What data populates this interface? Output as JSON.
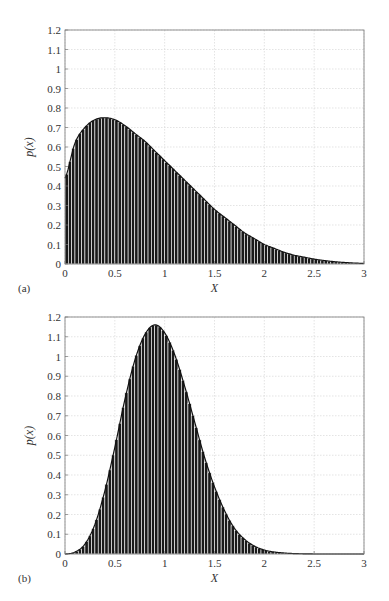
{
  "header_fragment": "",
  "chart_data": [
    {
      "type": "bar",
      "panel_label": "(a)",
      "title": "",
      "xlabel": "X",
      "ylabel": "p(x)",
      "xlim": [
        0,
        3
      ],
      "ylim": [
        0,
        1.2
      ],
      "xticks": [
        0,
        0.5,
        1,
        1.5,
        2,
        2.5,
        3
      ],
      "xtick_labels": [
        "0",
        "0.5",
        "1",
        "1.5",
        "2",
        "2.5",
        "3"
      ],
      "yticks": [
        0,
        0.1,
        0.2,
        0.3,
        0.4,
        0.5,
        0.6,
        0.7,
        0.8,
        0.9,
        1,
        1.1,
        1.2
      ],
      "ytick_labels": [
        "0",
        "0.1",
        "0.2",
        "0.3",
        "0.4",
        "0.5",
        "0.6",
        "0.7",
        "0.8",
        "0.9",
        "1",
        "1.1",
        "1.2"
      ],
      "grid": true,
      "bar_color": "#1a1a1a",
      "description": "Histogram of samples with overlaid PDF curve; skewed right, peak ~0.75 near x=0.4",
      "x": [
        0,
        0.1,
        0.2,
        0.3,
        0.4,
        0.5,
        0.6,
        0.7,
        0.8,
        0.9,
        1.0,
        1.1,
        1.2,
        1.3,
        1.4,
        1.5,
        1.6,
        1.7,
        1.8,
        1.9,
        2.0,
        2.1,
        2.2,
        2.3,
        2.4,
        2.5,
        2.6,
        2.7,
        2.8,
        2.9,
        3.0
      ],
      "values": [
        0.44,
        0.62,
        0.7,
        0.74,
        0.75,
        0.74,
        0.71,
        0.67,
        0.63,
        0.58,
        0.53,
        0.48,
        0.43,
        0.38,
        0.33,
        0.28,
        0.24,
        0.2,
        0.16,
        0.13,
        0.1,
        0.08,
        0.06,
        0.045,
        0.035,
        0.025,
        0.018,
        0.012,
        0.008,
        0.005,
        0.003
      ]
    },
    {
      "type": "bar",
      "panel_label": "(b)",
      "title": "",
      "xlabel": "X",
      "ylabel": "p(x)",
      "xlim": [
        0,
        3
      ],
      "ylim": [
        0,
        1.2
      ],
      "xticks": [
        0,
        0.5,
        1,
        1.5,
        2,
        2.5,
        3
      ],
      "xtick_labels": [
        "0",
        "0.5",
        "1",
        "1.5",
        "2",
        "2.5",
        "3"
      ],
      "yticks": [
        0,
        0.1,
        0.2,
        0.3,
        0.4,
        0.5,
        0.6,
        0.7,
        0.8,
        0.9,
        1,
        1.1,
        1.2
      ],
      "ytick_labels": [
        "0",
        "0.1",
        "0.2",
        "0.3",
        "0.4",
        "0.5",
        "0.6",
        "0.7",
        "0.8",
        "0.9",
        "1",
        "1.1",
        "1.2"
      ],
      "grid": true,
      "bar_color": "#1a1a1a",
      "description": "Histogram of samples with overlaid PDF curve; bell-shaped, peak ~1.16 near x=0.9",
      "x": [
        0,
        0.1,
        0.2,
        0.3,
        0.4,
        0.5,
        0.6,
        0.7,
        0.8,
        0.9,
        1.0,
        1.1,
        1.2,
        1.3,
        1.4,
        1.5,
        1.6,
        1.7,
        1.8,
        1.9,
        2.0,
        2.1,
        2.2,
        2.3,
        2.4,
        2.5,
        2.6,
        2.7,
        2.8,
        2.9,
        3.0
      ],
      "values": [
        0,
        0.01,
        0.05,
        0.15,
        0.32,
        0.54,
        0.78,
        0.98,
        1.11,
        1.16,
        1.12,
        1.01,
        0.85,
        0.67,
        0.49,
        0.34,
        0.22,
        0.13,
        0.075,
        0.04,
        0.02,
        0.01,
        0.005,
        0.002,
        0.001,
        0,
        0,
        0,
        0,
        0,
        0
      ]
    }
  ]
}
